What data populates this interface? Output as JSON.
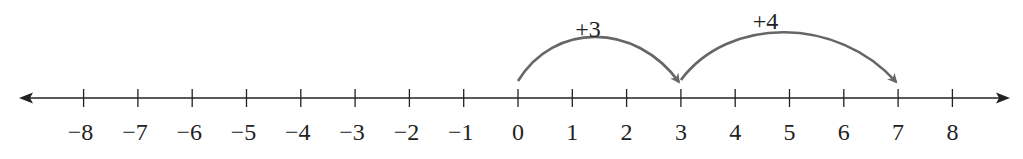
{
  "diagram": {
    "type": "number-line",
    "min": -8,
    "max": 8,
    "ticks": [
      -8,
      -7,
      -6,
      -5,
      -4,
      -3,
      -2,
      -1,
      0,
      1,
      2,
      3,
      4,
      5,
      6,
      7,
      8
    ],
    "tick_labels": [
      "−8",
      "−7",
      "−6",
      "−5",
      "−4",
      "−3",
      "−2",
      "−1",
      "0",
      "1",
      "2",
      "3",
      "4",
      "5",
      "6",
      "7",
      "8"
    ],
    "jumps": [
      {
        "from": 0,
        "to": 3,
        "label": "+3"
      },
      {
        "from": 3,
        "to": 7,
        "label": "+4"
      }
    ],
    "colors": {
      "axis": "#222222",
      "jump_arrow": "#666666",
      "text": "#222222"
    }
  }
}
